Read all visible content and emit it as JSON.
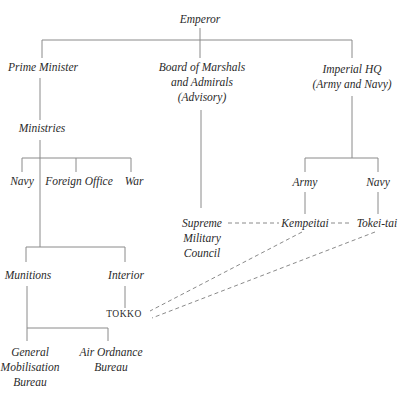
{
  "diagram": {
    "type": "organizational-chart",
    "nodes": {
      "emperor": {
        "label": "Emperor"
      },
      "prime_minister": {
        "label": "Prime Minister"
      },
      "board": {
        "lines": [
          "Board of Marshals",
          "and Admirals",
          "(Advisory)"
        ]
      },
      "imperial_hq": {
        "lines": [
          "Imperial HQ",
          "(Army and Navy)"
        ]
      },
      "ministries": {
        "label": "Ministries"
      },
      "navy_ministry": {
        "label": "Navy"
      },
      "foreign_office": {
        "label": "Foreign Office"
      },
      "war": {
        "label": "War"
      },
      "army": {
        "label": "Army"
      },
      "navy_hq": {
        "label": "Navy"
      },
      "supreme_council": {
        "lines": [
          "Supreme",
          "Military",
          "Council"
        ]
      },
      "kempeitai": {
        "label": "Kempeitai"
      },
      "tokei_tai": {
        "label": "Tokei-tai"
      },
      "munitions": {
        "label": "Munitions"
      },
      "interior": {
        "label": "Interior"
      },
      "tokko": {
        "label": "TOKKO"
      },
      "general_mobilisation": {
        "lines": [
          "General",
          "Mobilisation",
          "Bureau"
        ]
      },
      "air_ordnance": {
        "lines": [
          "Air Ordnance",
          "Bureau"
        ]
      }
    },
    "edges_solid": [
      [
        "Emperor",
        "Prime Minister"
      ],
      [
        "Emperor",
        "Board of Marshals and Admirals (Advisory)"
      ],
      [
        "Emperor",
        "Imperial HQ (Army and Navy)"
      ],
      [
        "Prime Minister",
        "Ministries"
      ],
      [
        "Ministries",
        "Navy"
      ],
      [
        "Ministries",
        "Foreign Office"
      ],
      [
        "Ministries",
        "War"
      ],
      [
        "Ministries",
        "Munitions"
      ],
      [
        "Ministries",
        "Interior"
      ],
      [
        "Board of Marshals and Admirals (Advisory)",
        "Supreme Military Council"
      ],
      [
        "Imperial HQ (Army and Navy)",
        "Army"
      ],
      [
        "Imperial HQ (Army and Navy)",
        "Navy"
      ],
      [
        "Army",
        "Kempeitai"
      ],
      [
        "Navy",
        "Tokei-tai"
      ],
      [
        "Interior",
        "TOKKO"
      ],
      [
        "Munitions",
        "General Mobilisation Bureau"
      ],
      [
        "Munitions",
        "Air Ordnance Bureau"
      ]
    ],
    "edges_dashed": [
      [
        "Supreme Military Council",
        "Kempeitai"
      ],
      [
        "Kempeitai",
        "Tokei-tai"
      ],
      [
        "Kempeitai",
        "TOKKO"
      ],
      [
        "Tokei-tai",
        "TOKKO"
      ]
    ],
    "colors": {
      "line": "#8a8a8a",
      "text": "#2a2a2a",
      "background": "#ffffff"
    }
  }
}
